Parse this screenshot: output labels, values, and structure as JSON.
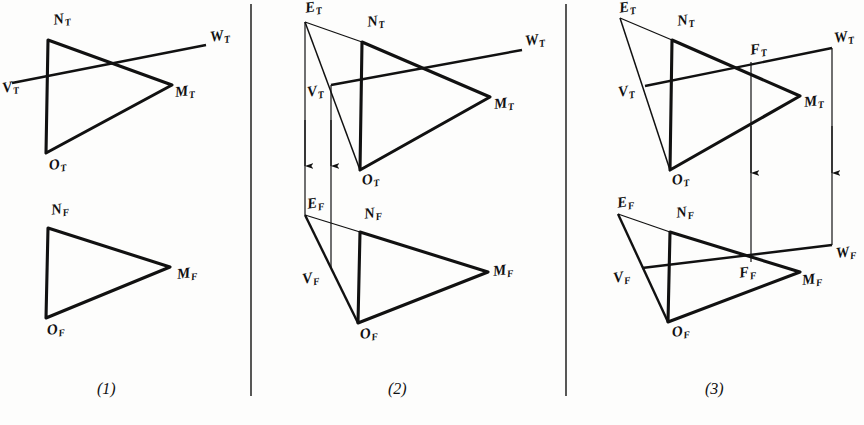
{
  "figure": {
    "background_color": "#fdfdfc",
    "ink_color": "#111111",
    "panel_count": 3
  },
  "dividers": [
    {
      "name": "divider-1",
      "x": 251,
      "y1": 4,
      "y2": 396
    },
    {
      "name": "divider-2",
      "x": 566,
      "y1": 4,
      "y2": 396
    }
  ],
  "captions": [
    {
      "name": "caption-panel-1",
      "text": "(1)",
      "x": 97,
      "y": 388
    },
    {
      "name": "caption-panel-2",
      "text": "(2)",
      "x": 388,
      "y": 388
    },
    {
      "name": "caption-panel-3",
      "text": "(3)",
      "x": 705,
      "y": 388
    }
  ],
  "panels": [
    {
      "id": "panel-1",
      "caption": "(1)",
      "description": "Given: plane MNO and line VW in top and front views",
      "views": [
        {
          "id": "top-view",
          "suffix": "T",
          "points": {
            "N": [
              48,
              40
            ],
            "O": [
              46,
              153
            ],
            "M": [
              172,
              85
            ],
            "V": [
              12,
              83
            ],
            "W": [
              206,
              45
            ]
          },
          "labels": [
            {
              "name": "label-NT",
              "base": "N",
              "sub": "T",
              "x": 52,
              "y": 12
            },
            {
              "name": "label-OT",
              "base": "O",
              "sub": "T",
              "x": 48,
              "y": 157
            },
            {
              "name": "label-MT",
              "base": "M",
              "sub": "T",
              "x": 172,
              "y": 86
            },
            {
              "name": "label-VT",
              "base": "V",
              "sub": "T",
              "x": 2,
              "y": 80
            },
            {
              "name": "label-WT",
              "base": "W",
              "sub": "T",
              "x": 209,
              "y": 28
            }
          ]
        },
        {
          "id": "front-view",
          "suffix": "F",
          "points": {
            "N": [
              48,
              228
            ],
            "O": [
              46,
              318
            ],
            "M": [
              170,
              267
            ]
          },
          "labels": [
            {
              "name": "label-NF",
              "base": "N",
              "sub": "F",
              "x": 50,
              "y": 202
            },
            {
              "name": "label-OF",
              "base": "O",
              "sub": "F",
              "x": 46,
              "y": 322
            },
            {
              "name": "label-MF",
              "base": "M",
              "sub": "F",
              "x": 174,
              "y": 268
            }
          ]
        }
      ]
    },
    {
      "id": "panel-2",
      "caption": "(2)",
      "description": "A cutting plane through VW gives line EO in top view; projected down to front view",
      "views": [
        {
          "id": "top-view",
          "suffix": "T",
          "points": {
            "E": [
              305,
              22
            ],
            "N": [
              362,
              42
            ],
            "O": [
              360,
              170
            ],
            "M": [
              490,
              97
            ],
            "V": [
              331,
              85
            ],
            "W": [
              522,
              50
            ]
          },
          "labels": [
            {
              "name": "label-ET",
              "base": "E",
              "sub": "T",
              "x": 305,
              "y": 0
            },
            {
              "name": "label-NT",
              "base": "N",
              "sub": "T",
              "x": 366,
              "y": 14
            },
            {
              "name": "label-OT",
              "base": "O",
              "sub": "T",
              "x": 360,
              "y": 172
            },
            {
              "name": "label-MT",
              "base": "M",
              "sub": "T",
              "x": 492,
              "y": 98
            },
            {
              "name": "label-VT",
              "base": "V",
              "sub": "T",
              "x": 306,
              "y": 84
            },
            {
              "name": "label-WT",
              "base": "W",
              "sub": "T",
              "x": 524,
              "y": 32
            }
          ]
        },
        {
          "id": "front-view",
          "suffix": "F",
          "points": {
            "E": [
              305,
              215
            ],
            "N": [
              360,
              232
            ],
            "O": [
              358,
              323
            ],
            "M": [
              488,
              272
            ],
            "V": [
              327,
              270
            ]
          },
          "labels": [
            {
              "name": "label-EF",
              "base": "E",
              "sub": "F",
              "x": 305,
              "y": 196
            },
            {
              "name": "label-NF",
              "base": "N",
              "sub": "F",
              "x": 362,
              "y": 206
            },
            {
              "name": "label-OF",
              "base": "O",
              "sub": "F",
              "x": 358,
              "y": 326
            },
            {
              "name": "label-MF",
              "base": "M",
              "sub": "F",
              "x": 492,
              "y": 264
            },
            {
              "name": "label-VF",
              "base": "V",
              "sub": "F",
              "x": 302,
              "y": 271
            }
          ]
        }
      ],
      "projectors": [
        {
          "name": "projector-E",
          "x": 305,
          "y1": 22,
          "y2": 215,
          "arrow_y": 165
        },
        {
          "name": "projector-V",
          "x": 331,
          "y1": 85,
          "y2": 268,
          "arrow_y": 165
        }
      ]
    },
    {
      "id": "panel-3",
      "caption": "(3)",
      "description": "Piercing point F located in front view, then projected back up to top view",
      "views": [
        {
          "id": "top-view",
          "suffix": "T",
          "points": {
            "E": [
              620,
              18
            ],
            "N": [
              672,
              40
            ],
            "O": [
              670,
              170
            ],
            "M": [
              800,
              96
            ],
            "V": [
              645,
              86
            ],
            "W": [
              832,
              48
            ],
            "F": [
              751,
              62
            ]
          },
          "labels": [
            {
              "name": "label-ET",
              "base": "E",
              "sub": "T",
              "x": 619,
              "y": 0
            },
            {
              "name": "label-NT",
              "base": "N",
              "sub": "T",
              "x": 676,
              "y": 13
            },
            {
              "name": "label-OT",
              "base": "O",
              "sub": "T",
              "x": 671,
              "y": 172
            },
            {
              "name": "label-MT",
              "base": "M",
              "sub": "T",
              "x": 802,
              "y": 96
            },
            {
              "name": "label-VT",
              "base": "V",
              "sub": "T",
              "x": 618,
              "y": 84
            },
            {
              "name": "label-WT",
              "base": "W",
              "sub": "T",
              "x": 834,
              "y": 30
            },
            {
              "name": "label-FT",
              "base": "F",
              "sub": "T",
              "x": 750,
              "y": 44
            }
          ]
        },
        {
          "id": "front-view",
          "suffix": "F",
          "points": {
            "E": [
              618,
              214
            ],
            "N": [
              670,
              232
            ],
            "O": [
              668,
              322
            ],
            "M": [
              800,
              272
            ],
            "V": [
              642,
              268
            ],
            "W": [
              832,
              245
            ],
            "F": [
              751,
              262
            ]
          },
          "labels": [
            {
              "name": "label-EF",
              "base": "E",
              "sub": "F",
              "x": 617,
              "y": 196
            },
            {
              "name": "label-NF",
              "base": "N",
              "sub": "F",
              "x": 674,
              "y": 206
            },
            {
              "name": "label-OF",
              "base": "O",
              "sub": "F",
              "x": 670,
              "y": 325
            },
            {
              "name": "label-MF",
              "base": "M",
              "sub": "F",
              "x": 800,
              "y": 272
            },
            {
              "name": "label-VF",
              "base": "V",
              "sub": "F",
              "x": 615,
              "y": 270
            },
            {
              "name": "label-WF",
              "base": "W",
              "sub": "F",
              "x": 833,
              "y": 246
            },
            {
              "name": "label-FF",
              "base": "F",
              "sub": "F",
              "x": 740,
              "y": 264
            }
          ]
        }
      ],
      "projectors": [
        {
          "name": "projector-F",
          "x": 751,
          "y1": 62,
          "y2": 262,
          "arrow_y": 172
        },
        {
          "name": "projector-W",
          "x": 832,
          "y1": 48,
          "y2": 245,
          "arrow_y": 172
        }
      ]
    }
  ]
}
